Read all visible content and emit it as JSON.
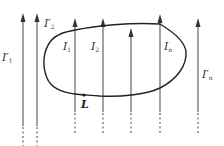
{
  "diagram": {
    "colors": {
      "line": "#555555",
      "loop": "#222222",
      "text": "#333333",
      "background": "#ffffff"
    },
    "loop_label": "L",
    "wires": [
      {
        "id": "ip1",
        "label_main": "I",
        "label_prime": "′",
        "label_sub": "1",
        "x": 23,
        "inside_loop": false
      },
      {
        "id": "ip2",
        "label_main": "I",
        "label_prime": "′",
        "label_sub": "2",
        "x": 37,
        "inside_loop": false
      },
      {
        "id": "i1",
        "label_main": "I",
        "label_prime": "",
        "label_sub": "1",
        "x": 75,
        "inside_loop": true
      },
      {
        "id": "i2",
        "label_main": "I",
        "label_prime": "",
        "label_sub": "2",
        "x": 103,
        "inside_loop": true
      },
      {
        "id": "i3",
        "label_main": "",
        "label_prime": "",
        "label_sub": "",
        "x": 131,
        "inside_loop": true
      },
      {
        "id": "in",
        "label_main": "I",
        "label_prime": "",
        "label_sub": "n",
        "x": 160,
        "inside_loop": true
      },
      {
        "id": "ipn",
        "label_main": "I",
        "label_prime": "′",
        "label_sub": "n",
        "x": 198,
        "inside_loop": false
      }
    ]
  }
}
